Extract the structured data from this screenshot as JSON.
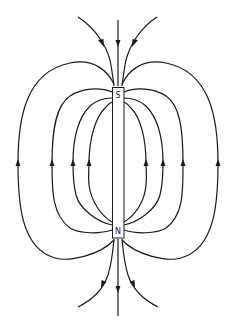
{
  "diagram": {
    "title": "",
    "magnet": {
      "top_label": "S",
      "bottom_label": "N",
      "x": 112,
      "y": 87,
      "width": 12,
      "height": 151
    },
    "colors": {
      "line": "#1a1a1a",
      "background": "#ffffff"
    },
    "field_lines": {
      "closed_loops_left_x_at_middle": [
        18,
        52,
        73,
        89
      ],
      "closed_loops_right_x_at_middle": [
        146,
        163,
        183,
        218
      ],
      "loop_arrow_direction": "up",
      "open_lines_top": 3,
      "open_lines_bottom": 3,
      "top_arrow_direction": "down (toward S)",
      "bottom_arrow_direction": "down (away from N)"
    }
  }
}
